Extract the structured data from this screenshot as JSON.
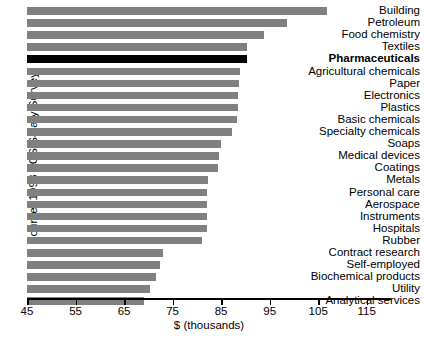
{
  "chart_data": {
    "type": "bar",
    "orientation": "horizontal",
    "title": "",
    "xlabel": "$ (thousands)",
    "ylabel": "Source: 1998 ACS Salary Survey",
    "xlim": [
      45,
      120
    ],
    "xticks": [
      45,
      55,
      65,
      75,
      85,
      95,
      105,
      115
    ],
    "grid": false,
    "legend": false,
    "highlight_category": "Pharmaceuticals",
    "colors": {
      "bar": "#808080",
      "highlight_bar": "#000000",
      "axis": "#000000",
      "background": "#ffffff"
    },
    "categories": [
      "Building",
      "Petroleum",
      "Food chemistry",
      "Textiles",
      "Pharmaceuticals",
      "Agricultural chemicals",
      "Paper",
      "Electronics",
      "Plastics",
      "Basic chemicals",
      "Specialty chemicals",
      "Soaps",
      "Medical devices",
      "Coatings",
      "Metals",
      "Personal care",
      "Aerospace",
      "Instruments",
      "Hospitals",
      "Rubber",
      "Contract research",
      "Self-employed",
      "Biochemical products",
      "Utility",
      "Analytical services"
    ],
    "values": [
      106.8,
      98.6,
      93.8,
      90.4,
      90.3,
      88.8,
      88.7,
      88.5,
      88.4,
      88.2,
      87.3,
      85.0,
      84.6,
      84.3,
      82.2,
      82.1,
      82.1,
      82.1,
      82.0,
      81.0,
      73.0,
      72.4,
      71.6,
      70.4,
      69.1
    ]
  },
  "axis": {
    "x_title": "$ (thousands)",
    "tick_labels": [
      "45",
      "55",
      "65",
      "75",
      "85",
      "95",
      "105",
      "115"
    ]
  },
  "source": {
    "caption": "Source: 1998 ACS Salary Survey"
  }
}
